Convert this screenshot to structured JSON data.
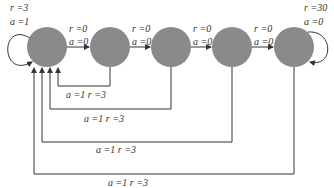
{
  "diagram": {
    "type": "state-transition-chain",
    "colors": {
      "state_fill": "#8a8a8a",
      "line": "#333333",
      "background": "#ffffff"
    },
    "states": [
      {
        "id": "s1",
        "cx": 47,
        "cy": 47
      },
      {
        "id": "s2",
        "cx": 110,
        "cy": 47
      },
      {
        "id": "s3",
        "cx": 171,
        "cy": 47
      },
      {
        "id": "s4",
        "cx": 232,
        "cy": 47
      },
      {
        "id": "s5",
        "cx": 294,
        "cy": 47
      }
    ],
    "self_loops": [
      {
        "state": "s1",
        "r_label": "r =3",
        "a_label": "a =1"
      },
      {
        "state": "s5",
        "r_label": "r =30",
        "a_label": "a =0"
      }
    ],
    "forward_edges": [
      {
        "from": "s1",
        "to": "s2",
        "r_label": "r =0",
        "a_label": "a =0"
      },
      {
        "from": "s2",
        "to": "s3",
        "r_label": "r =0",
        "a_label": "a =0"
      },
      {
        "from": "s3",
        "to": "s4",
        "r_label": "r =0",
        "a_label": "a =0"
      },
      {
        "from": "s4",
        "to": "s5",
        "r_label": "r =0",
        "a_label": "a =0"
      }
    ],
    "return_edges": [
      {
        "from": "s2",
        "to": "s1",
        "label": "a =1  r =3"
      },
      {
        "from": "s3",
        "to": "s1",
        "label": "a =1  r =3"
      },
      {
        "from": "s4",
        "to": "s1",
        "label": "a =1  r =3"
      },
      {
        "from": "s5",
        "to": "s1",
        "label": "a =1  r =3"
      }
    ]
  }
}
